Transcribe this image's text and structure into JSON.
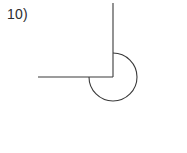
{
  "page": {
    "width": 187,
    "height": 153,
    "background_color": "#ffffff"
  },
  "problem": {
    "number_label": "10)"
  },
  "figure": {
    "stroke_color": "#3a3a3a",
    "stroke_width": 1.1,
    "vertex": {
      "x": 113,
      "y": 77
    },
    "rays": [
      {
        "name": "vertical-ray-up",
        "from": {
          "x": 113,
          "y": 77
        },
        "to": {
          "x": 113,
          "y": 3
        },
        "direction": "up"
      },
      {
        "name": "horizontal-ray-left",
        "from": {
          "x": 113,
          "y": 77
        },
        "to": {
          "x": 38,
          "y": 77
        },
        "direction": "left"
      }
    ],
    "arc": {
      "name": "reflex-angle-arc",
      "center": {
        "x": 113,
        "y": 77
      },
      "radius": 24,
      "start_point": {
        "x": 113,
        "y": 53
      },
      "end_point": {
        "x": 89,
        "y": 77
      },
      "sweep_degrees": 270,
      "sweep_direction": "clockwise",
      "path": "M 113 53 A 24 24 0 1 1 89 77"
    },
    "interior_angle_degrees": 90,
    "reflex_angle_degrees": 270
  }
}
